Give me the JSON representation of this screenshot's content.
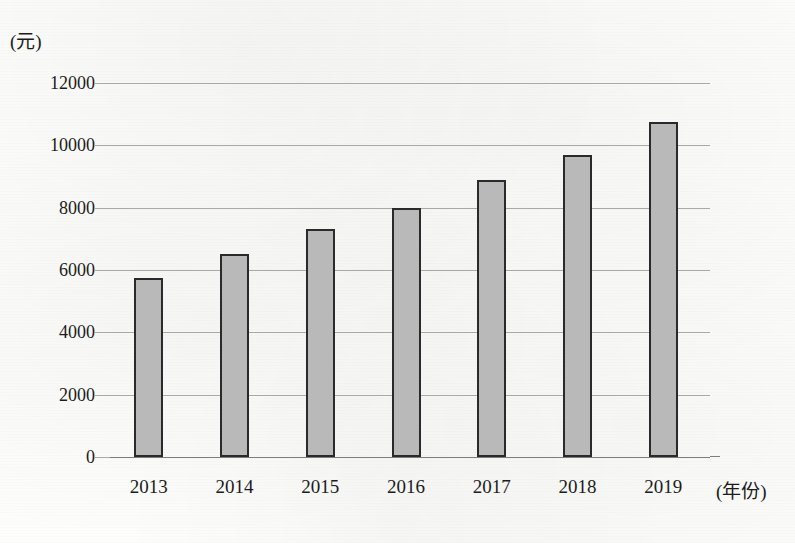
{
  "chart_data": {
    "type": "bar",
    "title": "",
    "xlabel": "(年份)",
    "ylabel": "(元)",
    "categories": [
      "2013",
      "2014",
      "2015",
      "2016",
      "2017",
      "2018",
      "2019"
    ],
    "values": [
      5750,
      6500,
      7300,
      8000,
      8900,
      9700,
      10750
    ],
    "series": [
      {
        "name": "",
        "values": [
          5750,
          6500,
          7300,
          8000,
          8900,
          9700,
          10750
        ]
      }
    ],
    "ylim": [
      0,
      12000
    ],
    "y_ticks": [
      12000,
      10000,
      8000,
      6000,
      4000,
      2000,
      0
    ],
    "y_tick_labels": [
      "12000",
      "10000",
      "8000",
      "6000",
      "4000",
      "2000",
      "0"
    ],
    "grid": true,
    "grid_axis": "y",
    "legend": false,
    "legend_position": "none",
    "bar_fill_color": "#b9b9b9",
    "bar_border_color": "#2a2a2a",
    "gridline_color": "#a9a9a9",
    "axis_color": "#7d7d7d",
    "text_color": "#1c1c1c",
    "background_color": "#fdfdfb"
  }
}
